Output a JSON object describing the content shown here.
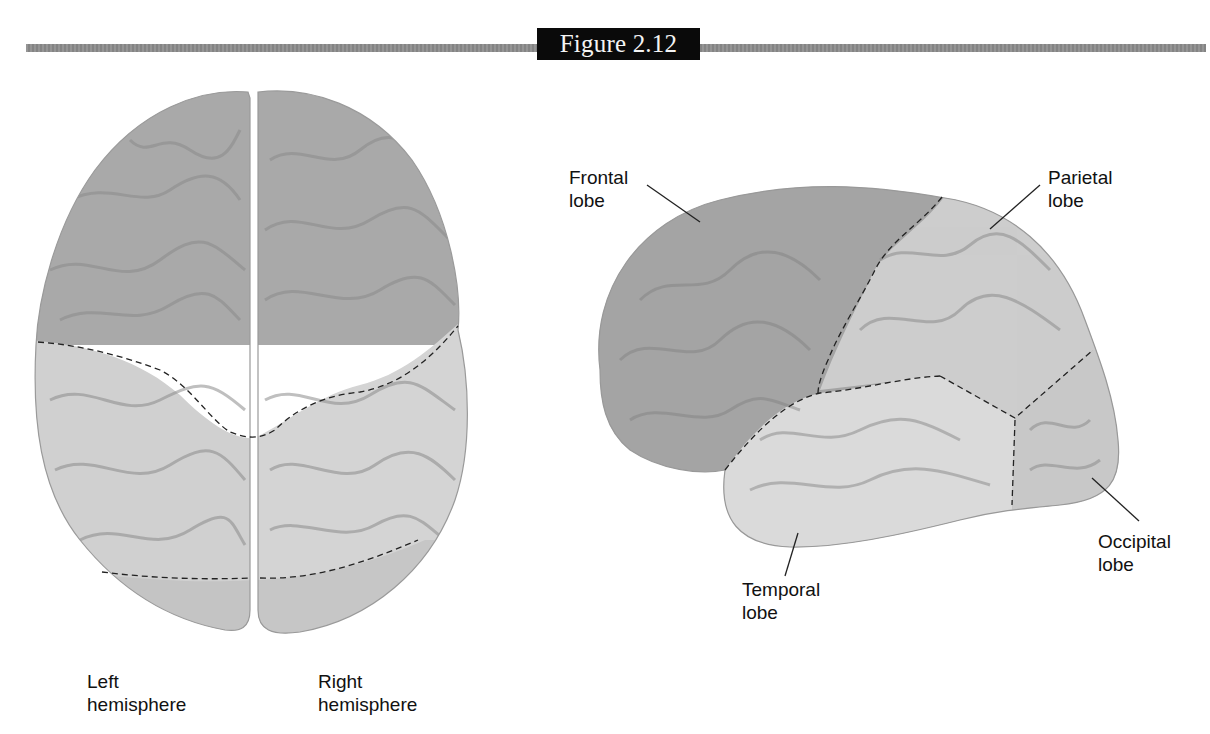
{
  "figure": {
    "title": "Figure 2.12",
    "band_color": "#8c8c8c",
    "title_bg": "#0a0a0a"
  },
  "top_view": {
    "left_label": {
      "line1": "Left",
      "line2": "hemisphere"
    },
    "right_label": {
      "line1": "Right",
      "line2": "hemisphere"
    },
    "colors": {
      "frontal": "#a9a9a9",
      "parietal": "#d2d2d2",
      "occipital": "#c6c6c6"
    }
  },
  "side_view": {
    "labels": {
      "frontal": {
        "line1": "Frontal",
        "line2": "lobe"
      },
      "parietal": {
        "line1": "Parietal",
        "line2": "lobe"
      },
      "temporal": {
        "line1": "Temporal",
        "line2": "lobe"
      },
      "occipital": {
        "line1": "Occipital",
        "line2": "lobe"
      }
    },
    "colors": {
      "frontal": "#a4a4a4",
      "parietal": "#cdcdcd",
      "temporal": "#dadada",
      "occipital": "#c8c8c8"
    }
  }
}
